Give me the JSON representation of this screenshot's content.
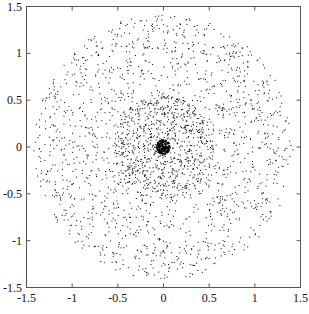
{
  "chart_data": {
    "type": "scatter",
    "title": "",
    "xlabel": "",
    "ylabel": "",
    "xlim": [
      -1.5,
      1.5
    ],
    "ylim": [
      -1.5,
      1.5
    ],
    "grid": false,
    "legend": null,
    "x_ticks": [
      -1.5,
      -1,
      -0.5,
      0,
      0.5,
      1,
      1.5
    ],
    "x_tick_labels": [
      "-1.5",
      "-1",
      "-0.5",
      "0",
      "0.5",
      "1",
      "1.5"
    ],
    "y_ticks": [
      -1.5,
      -1,
      -0.5,
      0,
      0.5,
      1,
      1.5
    ],
    "y_tick_labels": [
      "-1.5",
      "-1",
      "-0.5",
      "0",
      "0.5",
      "1",
      "1.5"
    ],
    "marker": {
      "shape": "dot",
      "size_px": 1,
      "color": "#000000"
    },
    "data_provenance": "Illustrative reconstruction — individual point coordinates are NOT extracted from the image. Points are procedurally generated to match the visually observed radial density profile.",
    "distribution_description": {
      "shape": "roughly circular cloud centered at origin",
      "dense_core": {
        "approx_radius": 0.08,
        "approx_points": 350
      },
      "inner_disk": {
        "approx_radius_range": [
          0.08,
          0.55
        ],
        "approx_points": 900
      },
      "outer_annulus": {
        "approx_radius_range": [
          0.55,
          1.42
        ],
        "approx_points": 1500
      }
    },
    "generator": {
      "seed": 12345,
      "bands": [
        {
          "r_min": 0.0,
          "r_max": 0.08,
          "count": 350
        },
        {
          "r_min": 0.08,
          "r_max": 0.55,
          "count": 900
        },
        {
          "r_min": 0.55,
          "r_max": 1.42,
          "count": 1500
        }
      ]
    }
  },
  "plot_area": {
    "left": 26,
    "top": 6,
    "right": 300,
    "bottom": 287
  },
  "colors": {
    "axis": "#555555",
    "point": "#000000",
    "background": "#ffffff"
  }
}
